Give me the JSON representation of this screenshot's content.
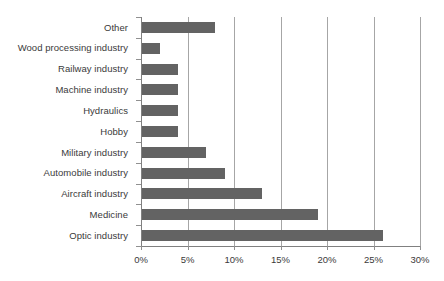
{
  "chart_data": {
    "type": "bar",
    "orientation": "horizontal",
    "title": "",
    "subtitle": "",
    "xlabel": "",
    "ylabel": "",
    "xlim": [
      0,
      30
    ],
    "ylim": null,
    "grid": "vertical",
    "legend": null,
    "legend_position": "none",
    "xtick_labels": [
      "0%",
      "5%",
      "10%",
      "15%",
      "20%",
      "25%",
      "30%"
    ],
    "xtick_values": [
      0,
      5,
      10,
      15,
      20,
      25,
      30
    ],
    "categories": [
      "Other",
      "Wood processing industry",
      "Railway industry",
      "Machine industry",
      "Hydraulics",
      "Hobby",
      "Military industry",
      "Automobile industry",
      "Aircraft industry",
      "Medicine",
      "Optic industry"
    ],
    "values": [
      8,
      2,
      4,
      4,
      4,
      4,
      7,
      9,
      13,
      19,
      26
    ],
    "value_unit": "%",
    "series": [
      {
        "name": "Share",
        "values": [
          8,
          2,
          4,
          4,
          4,
          4,
          7,
          9,
          13,
          19,
          26
        ]
      }
    ],
    "colors": {
      "bar": "#636363",
      "gridline": "#a6a6a6",
      "axis": "#808080",
      "text": "#3a3a3a",
      "background": "#ffffff"
    }
  }
}
